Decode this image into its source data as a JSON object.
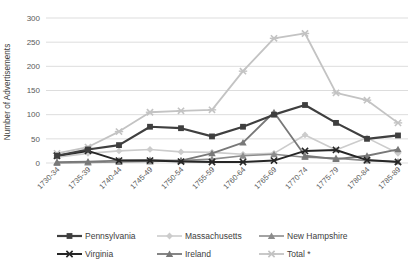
{
  "chart_data": {
    "type": "line",
    "title": "",
    "xlabel": "",
    "ylabel": "Number of Advertisements",
    "ylim": [
      0,
      300
    ],
    "ytick_step": 50,
    "grid": true,
    "legend_position": "bottom",
    "background": "#ffffff",
    "gridline_color": "#d9d9d9",
    "tick_label_color": "#595959",
    "categories": [
      "1730-34",
      "1735-39",
      "1740-44",
      "1745-49",
      "1750-54",
      "1755-59",
      "1760-64",
      "1765-69",
      "1770-74",
      "1775-79",
      "1780-84",
      "1785-89"
    ],
    "series": [
      {
        "name": "Pennsylvania",
        "marker": "square",
        "color": "#3f3f3f",
        "line_width": 2.2,
        "values": [
          15,
          28,
          37,
          75,
          72,
          55,
          75,
          100,
          120,
          83,
          50,
          57
        ]
      },
      {
        "name": "Massachusetts",
        "marker": "diamond",
        "color": "#cccccc",
        "line_width": 1.6,
        "values": [
          12,
          20,
          25,
          28,
          23,
          22,
          18,
          20,
          58,
          27,
          52,
          20
        ]
      },
      {
        "name": "New Hampshire",
        "marker": "triangle",
        "color": "#8c8c8c",
        "line_width": 1.6,
        "values": [
          0,
          1,
          2,
          3,
          5,
          8,
          15,
          18,
          12,
          10,
          5,
          3
        ]
      },
      {
        "name": "Virginia",
        "marker": "x",
        "color": "#262626",
        "line_width": 2.0,
        "values": [
          15,
          25,
          5,
          5,
          3,
          2,
          2,
          5,
          25,
          27,
          6,
          2
        ]
      },
      {
        "name": "Ireland",
        "marker": "triangle",
        "color": "#787878",
        "line_width": 1.8,
        "values": [
          2,
          3,
          5,
          6,
          5,
          20,
          42,
          105,
          15,
          8,
          15,
          28
        ]
      },
      {
        "name": "Total *",
        "marker": "asterisk",
        "color": "#c3c3c3",
        "line_width": 1.8,
        "values": [
          20,
          33,
          65,
          105,
          108,
          110,
          190,
          258,
          268,
          145,
          130,
          83
        ]
      }
    ],
    "draw_order": [
      "Total *",
      "Massachusetts",
      "New Hampshire",
      "Ireland",
      "Virginia",
      "Pennsylvania"
    ]
  }
}
